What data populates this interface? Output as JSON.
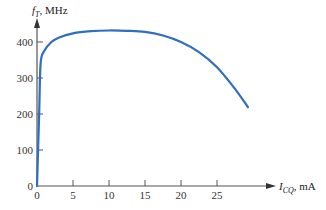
{
  "chart_data": {
    "type": "line",
    "title": "",
    "xlabel": "I_CQ, mA",
    "ylabel": "f_T, MHz",
    "xlim": [
      0,
      30
    ],
    "ylim": [
      0,
      450
    ],
    "grid": false,
    "x_ticks": [
      "0",
      "5",
      "10",
      "15",
      "20",
      "25"
    ],
    "y_ticks": [
      "0",
      "100",
      "200",
      "300",
      "400"
    ],
    "series": [
      {
        "name": "f_T vs I_CQ",
        "color": "#2f6fbf",
        "x": [
          0,
          0.3,
          0.5,
          1,
          2,
          3,
          5,
          7.5,
          10,
          12.5,
          15,
          17.5,
          20,
          22.5,
          25,
          27.5,
          29.3
        ],
        "y": [
          0,
          200,
          340,
          375,
          400,
          412,
          424,
          430,
          432,
          431,
          428,
          418,
          400,
          372,
          330,
          270,
          219
        ]
      }
    ]
  },
  "axes": {
    "y_label_main": "f",
    "y_label_sub": "T",
    "y_label_unit": ", MHz",
    "x_label_main": "I",
    "x_label_sub": "CQ",
    "x_label_unit": ", mA",
    "origin_y_label": "0"
  }
}
